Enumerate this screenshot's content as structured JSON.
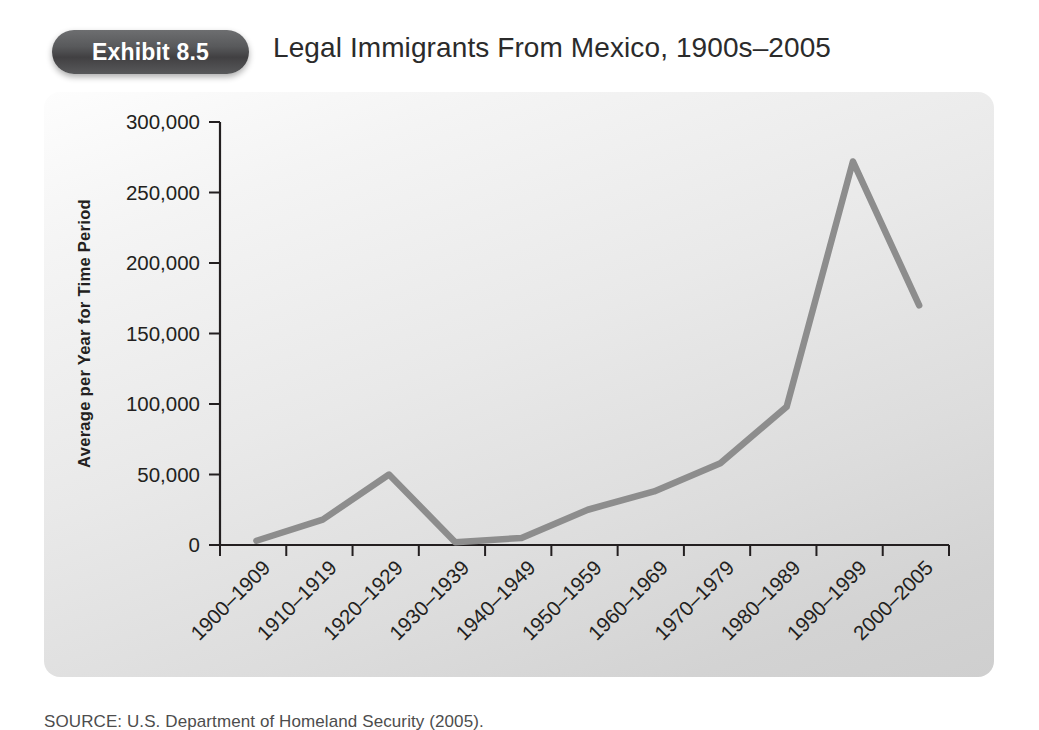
{
  "header": {
    "badge_label": "Exhibit 8.5",
    "title": "Legal Immigrants From Mexico, 1900s–2005"
  },
  "source": {
    "text": "SOURCE: U.S. Department of Homeland Security (2005)."
  },
  "colors": {
    "line": "#8d8d8d",
    "axis": "#231f20",
    "badge_dark": "#414042",
    "badge_light": "#6d6e70",
    "panel_light": "#fdfdfd",
    "panel_dark": "#cfcfcf",
    "text": "#231f20"
  },
  "chart_data": {
    "type": "line",
    "title": "Legal Immigrants From Mexico, 1900s–2005",
    "xlabel": "",
    "ylabel": "Average per Year for Time Period",
    "categories": [
      "1900–1909",
      "1910–1919",
      "1920–1929",
      "1930–1939",
      "1940–1949",
      "1950–1959",
      "1960–1969",
      "1970–1979",
      "1980–1989",
      "1990–1999",
      "2000–2005"
    ],
    "values": [
      3000,
      18000,
      50000,
      2000,
      5000,
      25000,
      38000,
      58000,
      98000,
      272000,
      170000
    ],
    "ylim": [
      0,
      300000
    ],
    "yticks": [
      0,
      50000,
      100000,
      150000,
      200000,
      250000,
      300000
    ],
    "ytick_labels": [
      "0",
      "50,000",
      "100,000",
      "150,000",
      "200,000",
      "250,000",
      "300,000"
    ],
    "grid": false,
    "legend": false,
    "series_color": "#8d8d8d"
  }
}
